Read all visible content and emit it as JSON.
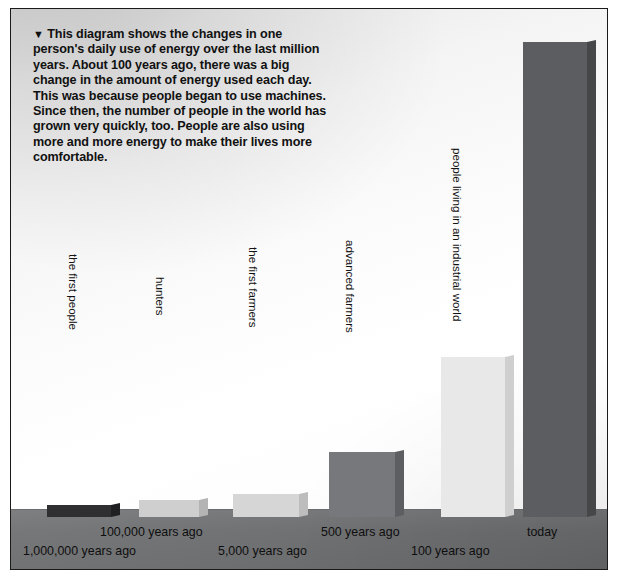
{
  "figure": {
    "caption_marker": "▼",
    "caption": "This diagram shows the changes in one person's daily use of energy over the last million years. About 100 years ago, there was a big change in the amount of energy used each day. This was because people began to use machines. Since then, the number of people in the world has grown very quickly, too. People are also using more and more energy to make their lives more comfortable.",
    "ground_color": "#6f7072",
    "background_color": "#ffffff",
    "frame_color": "#1a1a1a"
  },
  "chart_data": {
    "type": "bar",
    "title": "Changes in one person's daily use of energy over the last million years",
    "xlabel": "",
    "ylabel": "daily energy use per person",
    "grid": false,
    "legend": "none",
    "categories": [
      "1,000,000 years ago",
      "100,000 years ago",
      "5,000 years ago",
      "500 years ago",
      "100 years ago",
      "today"
    ],
    "series_labels": [
      "the first people",
      "hunters",
      "the first farmers",
      "advanced farmers",
      "people living in an industrial world",
      "today"
    ],
    "values": [
      2,
      5,
      6,
      14,
      34,
      100
    ],
    "ylim": [
      0,
      100
    ],
    "value_units": "relative daily energy use (today = 100)",
    "bar_colors": [
      "#3b3b3d",
      "#d2d2d2",
      "#d9d9d9",
      "#77797c",
      "#eaeaea",
      "#5e6063"
    ]
  },
  "bars": [
    {
      "name": "the first people",
      "era": "1,000,000 years ago",
      "value": 2,
      "left": 36,
      "width": 64,
      "top": 496,
      "front": "#2f2f31",
      "side": "#202022",
      "topface": "#9a9a9c",
      "label_x": 69,
      "label_y": 245,
      "era_x": 12,
      "era_y": 535
    },
    {
      "name": "hunters",
      "era": "100,000 years ago",
      "value": 5,
      "left": 128,
      "width": 60,
      "top": 491,
      "front": "#cfcfcf",
      "side": "#b4b4b4",
      "topface": "#e4e4e4",
      "label_x": 156,
      "label_y": 268,
      "era_x": 89,
      "era_y": 516
    },
    {
      "name": "the first farmers",
      "era": "5,000 years ago",
      "value": 6,
      "left": 222,
      "width": 66,
      "top": 485,
      "front": "#d6d6d6",
      "side": "#bdbdbd",
      "topface": "#e9e9e9",
      "label_x": 249,
      "label_y": 238,
      "era_x": 207,
      "era_y": 535
    },
    {
      "name": "advanced farmers",
      "era": "500 years ago",
      "value": 14,
      "left": 318,
      "width": 66,
      "top": 443,
      "front": "#76787b",
      "side": "#5c5e61",
      "topface": "#96989b",
      "label_x": 346,
      "label_y": 231,
      "era_x": 310,
      "era_y": 516
    },
    {
      "name": "people living in an industrial world",
      "era": "100 years ago",
      "value": 34,
      "left": 430,
      "width": 64,
      "top": 348,
      "front": "#e8e8e8",
      "side": "#cfcfcf",
      "topface": "#f4f4f4",
      "label_x": 453,
      "label_y": 139,
      "era_x": 400,
      "era_y": 535
    },
    {
      "name": "today",
      "era": "today",
      "value": 100,
      "left": 512,
      "width": 64,
      "top": 33,
      "front": "#5b5d60",
      "side": "#464749",
      "topface": "#7d7f82",
      "label_x": 0,
      "label_y": 0,
      "era_x": 516,
      "era_y": 516
    }
  ]
}
